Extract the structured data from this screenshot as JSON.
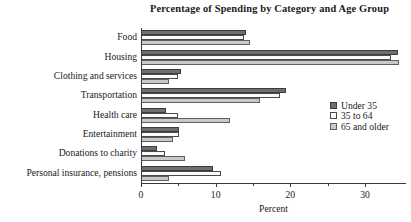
{
  "chart_data": {
    "type": "bar",
    "orientation": "horizontal",
    "title": "Percentage of Spending by Category and Age Group",
    "xlabel": "Percent",
    "ylabel": "",
    "xlim": [
      0,
      35.5
    ],
    "xticks": [
      0,
      10,
      20,
      30
    ],
    "xtick_labels": [
      "0",
      "10",
      "20",
      "30"
    ],
    "xminorticks": [
      5,
      15,
      25
    ],
    "grid": false,
    "legend_position": "right-middle",
    "categories": [
      "Food",
      "Housing",
      "Clothing and services",
      "Transportation",
      "Health care",
      "Entertainment",
      "Donations to charity",
      "Personal insurance, pensions"
    ],
    "series": [
      {
        "name": "Under 35",
        "color": "#6e6e6e",
        "values": [
          14.1,
          34.4,
          5.4,
          19.4,
          3.4,
          5.1,
          2.1,
          9.6
        ]
      },
      {
        "name": "35 to 64",
        "color": "#fbfbfb",
        "values": [
          13.8,
          33.5,
          4.9,
          18.6,
          4.9,
          5.1,
          3.2,
          10.7
        ]
      },
      {
        "name": "65 and older",
        "color": "#c9c9c9",
        "values": [
          14.6,
          34.5,
          3.7,
          16.0,
          11.9,
          4.3,
          5.9,
          3.8
        ]
      }
    ]
  }
}
